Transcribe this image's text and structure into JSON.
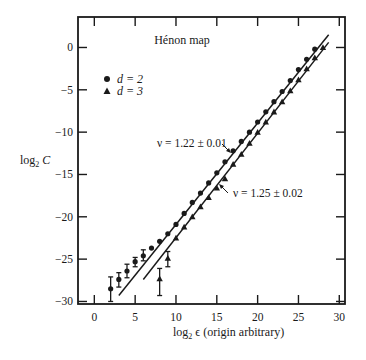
{
  "chart_data": {
    "type": "scatter",
    "title": "Hénon map",
    "xlabel": "log₂ ϵ (origin arbitrary)",
    "xlabel_main": "log",
    "xlabel_sub": "2",
    "xlabel_rest": " ϵ (origin arbitrary)",
    "ylabel_main": "log",
    "ylabel_sub": "2",
    "ylabel_rest": " C",
    "ylabel": "log₂ C",
    "xlim": [
      -2,
      30.7
    ],
    "ylim": [
      -30.3,
      3.6
    ],
    "xticks": [
      0,
      5,
      10,
      15,
      20,
      25,
      30
    ],
    "yticks": [
      0,
      -5,
      -10,
      -15,
      -20,
      -25,
      -30
    ],
    "grid": false,
    "legend": {
      "position": "upper left",
      "entries": [
        {
          "marker": "circle",
          "label": "d = 2"
        },
        {
          "marker": "triangle",
          "label": "d = 3"
        }
      ]
    },
    "series": [
      {
        "name": "d = 2",
        "marker": "circle",
        "x": [
          2,
          3,
          4,
          5,
          6,
          7,
          8,
          9,
          10,
          11,
          12,
          13,
          14,
          15,
          16,
          17,
          18,
          19,
          20,
          21,
          22,
          23,
          24,
          25,
          26,
          27
        ],
        "y": [
          -28.5,
          -27.4,
          -26.4,
          -25.3,
          -24.6,
          -23.7,
          -22.9,
          -22.0,
          -20.9,
          -19.6,
          -18.3,
          -17.2,
          -16.0,
          -14.8,
          -13.5,
          -12.2,
          -11.1,
          -10.0,
          -8.8,
          -7.6,
          -6.4,
          -5.2,
          -3.9,
          -2.6,
          -1.4,
          -0.2
        ],
        "error_bars": [
          {
            "x": 2,
            "low": -30.0,
            "high": -27.1
          },
          {
            "x": 3,
            "low": -28.3,
            "high": -26.6
          },
          {
            "x": 4,
            "low": -27.2,
            "high": -25.6
          },
          {
            "x": 5,
            "low": -25.9,
            "high": -24.8
          },
          {
            "x": 6,
            "low": -25.2,
            "high": -23.9
          }
        ],
        "fit": {
          "x": [
            3,
            28.7
          ],
          "y": [
            -29.3,
            1.5
          ],
          "slope_label": "ν = 1.22 ± 0.01"
        }
      },
      {
        "name": "d = 3",
        "marker": "triangle",
        "x": [
          8,
          9,
          10,
          11,
          12,
          13,
          14,
          15,
          16,
          17,
          18,
          19,
          20,
          21,
          22,
          23,
          24,
          25,
          26,
          27,
          28
        ],
        "y": [
          -27.3,
          -24.9,
          -22.5,
          -21.2,
          -20.0,
          -18.8,
          -17.7,
          -16.6,
          -15.5,
          -13.8,
          -12.6,
          -11.3,
          -10.0,
          -8.8,
          -7.6,
          -6.4,
          -5.1,
          -3.8,
          -2.5,
          -1.2,
          0.0
        ],
        "error_bars": [
          {
            "x": 8,
            "low": -29.3,
            "high": -26.1
          },
          {
            "x": 9,
            "low": -25.9,
            "high": -24.1
          }
        ],
        "fit": {
          "x": [
            6,
            28.7
          ],
          "y": [
            -27.4,
            0.6
          ],
          "slope_label": "ν = 1.25 ± 0.02"
        }
      }
    ],
    "annotations": [
      {
        "text": "ν = 1.22 ± 0.01",
        "refers_to": "d = 2 fit"
      },
      {
        "text": "ν = 1.25 ± 0.02",
        "refers_to": "d = 3 fit"
      }
    ]
  },
  "colors": {
    "ink": "#1a1a1a",
    "background": "#ffffff"
  }
}
